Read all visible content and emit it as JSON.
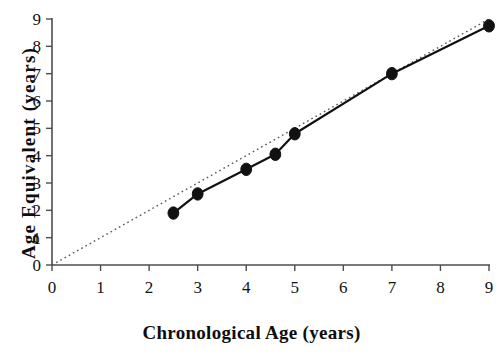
{
  "chart_data": {
    "type": "line",
    "title": "",
    "xlabel": "Chronological Age (years)",
    "ylabel": "Age Equivalent (years)",
    "xlim": [
      0,
      9
    ],
    "ylim": [
      0,
      9
    ],
    "xticks": [
      0,
      1,
      2,
      3,
      4,
      5,
      6,
      7,
      8,
      9
    ],
    "yticks": [
      0,
      1,
      2,
      3,
      4,
      5,
      6,
      7,
      8,
      9
    ],
    "xtick_labels": [
      "0",
      "1",
      "2",
      "3",
      "4",
      "5",
      "6",
      "7",
      "8",
      "9"
    ],
    "ytick_labels": [
      "0",
      "1",
      "2",
      "3",
      "4",
      "5",
      "6",
      "7",
      "8",
      "9"
    ],
    "grid": false,
    "legend": "none",
    "series": [
      {
        "name": "Age Equivalent",
        "style": "solid-line-with-markers",
        "marker": "filled-circle",
        "color": "#111111",
        "x": [
          2.5,
          3.0,
          4.0,
          4.6,
          5.0,
          7.0,
          9.0
        ],
        "y": [
          1.9,
          2.6,
          3.5,
          4.05,
          4.8,
          7.0,
          8.75
        ]
      },
      {
        "name": "Identity reference line",
        "style": "dotted-line",
        "marker": "none",
        "color": "#555555",
        "x": [
          0,
          9
        ],
        "y": [
          0,
          9
        ]
      }
    ]
  },
  "axes": {
    "x_title": "Chronological Age (years)",
    "y_title": "Age Equivalent (years)"
  }
}
